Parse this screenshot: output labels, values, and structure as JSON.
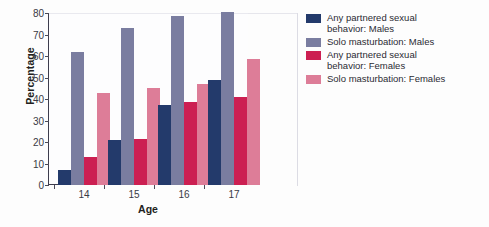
{
  "chart_data": {
    "type": "bar",
    "title": "",
    "xlabel": "Age",
    "ylabel": "Percentage",
    "categories": [
      "14",
      "15",
      "16",
      "17"
    ],
    "ylim": [
      0,
      80
    ],
    "yticks": [
      0,
      10,
      20,
      30,
      40,
      50,
      60,
      70,
      80
    ],
    "grid": false,
    "legend_position": "right",
    "series": [
      {
        "name": "Any partnered sexual behavior: Males",
        "color": "#233a6b",
        "values": [
          7,
          21,
          37,
          49
        ]
      },
      {
        "name": "Solo masturbation: Males",
        "color": "#7a7da0",
        "values": [
          62,
          73,
          78.5,
          80.5
        ]
      },
      {
        "name": "Any partnered sexual behavior: Females",
        "color": "#cc1f52",
        "values": [
          13,
          21.5,
          38.5,
          41
        ]
      },
      {
        "name": "Solo masturbation: Females",
        "color": "#dd7d98",
        "values": [
          43,
          45,
          47,
          58.5
        ]
      }
    ]
  },
  "legend": {
    "entries": [
      {
        "line1": "Any partnered sexual",
        "line2": "behavior: Males"
      },
      {
        "line1": "Solo masturbation: Males",
        "line2": ""
      },
      {
        "line1": "Any partnered sexual",
        "line2": "behavior: Females"
      },
      {
        "line1": "Solo masturbation: Females",
        "line2": ""
      }
    ]
  }
}
